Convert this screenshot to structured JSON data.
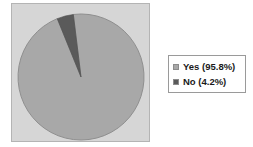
{
  "chart_data": {
    "type": "pie",
    "title": "",
    "categories": [
      "Yes",
      "No"
    ],
    "values": [
      95.8,
      4.2
    ],
    "labels": [
      "Yes (95.8%)",
      "No (4.2%)"
    ],
    "units": "percent",
    "start_angle_deg": -7,
    "direction": "clockwise",
    "legend_position": "right",
    "grid": false,
    "slices": [
      {
        "name": "Yes",
        "value": 95.8,
        "legend_text": "Yes (95.8%)",
        "color": "#a8a8a8",
        "start_deg": 8,
        "end_deg": 353
      },
      {
        "name": "No",
        "value": 4.2,
        "legend_text": "No (4.2%)",
        "color": "#5a5a5a",
        "start_deg": 353,
        "end_deg": 368
      }
    ]
  },
  "plot": {
    "panel_background": "#d6d6d6",
    "panel_border": "#b4b4b4",
    "pie_outline": "#8f8f8f",
    "center_x": 69,
    "center_y": 73,
    "radius": 63
  },
  "legend": {
    "background": "#ffffff",
    "border": "#9a9a9a",
    "items": [
      {
        "label": "Yes (95.8%)",
        "color": "#a8a8a8"
      },
      {
        "label": "No (4.2%)",
        "color": "#5a5a5a"
      }
    ]
  }
}
